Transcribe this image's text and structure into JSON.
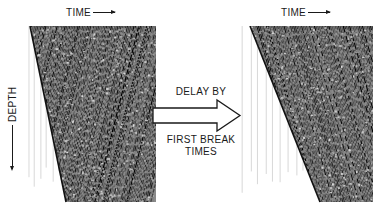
{
  "figure": {
    "left_panel": {
      "time_label": "TIME",
      "depth_label": "DEPTH",
      "description": "Raw VSP traces with sloping first-break"
    },
    "right_panel": {
      "time_label": "TIME",
      "description": "Traces after delay by first break times"
    },
    "operation": {
      "line1": "DELAY BY",
      "line2": "FIRST BREAK",
      "line3": "TIMES"
    },
    "colors": {
      "ink": "#1a1a1a",
      "background": "#ffffff",
      "faint_trace": "#c8c8c8"
    }
  }
}
